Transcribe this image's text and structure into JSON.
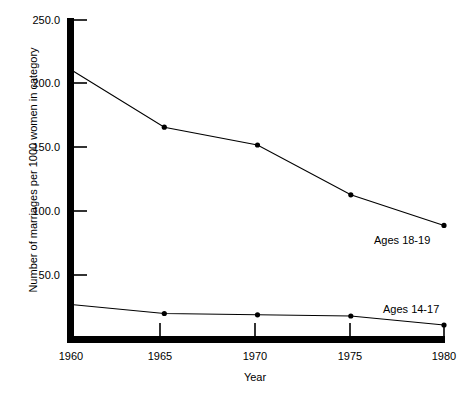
{
  "chart_data": {
    "type": "line",
    "title": "",
    "xlabel": "Year",
    "ylabel": "Number of marriages per 1000 women in category",
    "x": [
      1960,
      1965,
      1970,
      1975,
      1980
    ],
    "xticklabels": [
      "1960",
      "1965",
      "1970",
      "1975",
      "1980"
    ],
    "yticks": [
      50.0,
      100.0,
      150.0,
      200.0,
      250.0
    ],
    "yticklabels": [
      "50.0",
      "100.0",
      "150.0",
      "200.0",
      "250.0"
    ],
    "xlim": [
      1960,
      1980
    ],
    "ylim": [
      0,
      250
    ],
    "grid": false,
    "legend_position": "inline-right-of-series",
    "series": [
      {
        "name": "Ages 18-19",
        "label": "Ages 18-19",
        "values": [
          211,
          166,
          152,
          113,
          89
        ],
        "color": "#000000",
        "marker": "dot"
      },
      {
        "name": "Ages 14-17",
        "label": "Ages 14-17",
        "values": [
          27,
          20,
          19,
          18,
          11
        ],
        "color": "#000000",
        "marker": "dot"
      }
    ]
  },
  "axis": {
    "y_tick_250": "250.0",
    "y_tick_200": "200.0",
    "y_tick_150": "150.0",
    "y_tick_100": "100.0",
    "y_tick_50": "50.0",
    "x_tick_1960": "1960",
    "x_tick_1965": "1965",
    "x_tick_1970": "1970",
    "x_tick_1975": "1975",
    "x_tick_1980": "1980",
    "x_title": "Year",
    "y_title": "Number of marriages per 1000 women in category"
  },
  "series_labels": {
    "upper": "Ages 18-19",
    "lower": "Ages 14-17"
  },
  "colors": {
    "axis": "#000000",
    "line": "#000000",
    "background": "#ffffff"
  }
}
